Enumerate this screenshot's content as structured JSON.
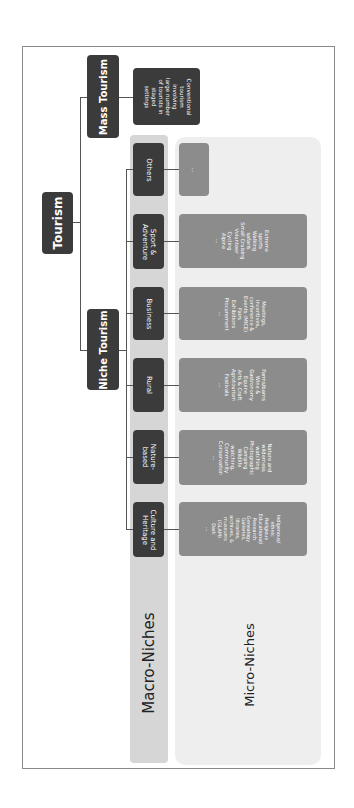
{
  "diagram": {
    "root": "Tourism",
    "branches": {
      "mass": {
        "label": "Mass Tourism",
        "description": [
          "Conventional",
          "tourism",
          "involving",
          "large number",
          "of tourists in",
          "staged",
          "settings"
        ]
      },
      "niche": {
        "label": "Niche Tourism"
      }
    },
    "levels": {
      "macro_label": "Macro-Niches",
      "micro_label": "Micro-Niches"
    },
    "macro_niches": [
      {
        "label": [
          "Culture and",
          "Heritage"
        ],
        "micro": [
          "Indigenous/",
          "ethnic",
          "Religious",
          "Educational/",
          "Research",
          "Genealogy",
          "Galleries,",
          "libraries,",
          "archives, &",
          "museums",
          "(GLAM)",
          "Dark",
          "..."
        ]
      },
      {
        "label": [
          "Nature-",
          "based"
        ],
        "micro": [
          "Nature and",
          "wilderness",
          "watching",
          "Photographic",
          "Camping",
          "Wildlife",
          "watching,",
          "Community",
          "Conservation",
          "..."
        ]
      },
      {
        "label": [
          "Rural"
        ],
        "micro": [
          "Farms/barns",
          "Wine &",
          "Gastronomy",
          "Equine",
          "Arts & Craft",
          "Agrotourism",
          "Festivals",
          "..."
        ]
      },
      {
        "label": [
          "Business"
        ],
        "micro": [
          "Meetings,",
          "Incentives,",
          "conference &",
          "Events (MICE)",
          "Fairs",
          "Exhibitions",
          "Procurement",
          "..."
        ]
      },
      {
        "label": [
          "Sport &",
          "Adventure"
        ],
        "micro": [
          "Extreme",
          "sports",
          "Walking",
          "safaris",
          "Small Cruising",
          "Volunteer",
          "Cycling",
          "Alpine",
          "..."
        ]
      },
      {
        "label": [
          "Others"
        ],
        "micro": [
          "..."
        ]
      }
    ]
  },
  "colors": {
    "dark_box": "#3b3b3b",
    "micro_box": "#8c8c8c",
    "macro_strip": "#d6d6d6",
    "micro_strip": "#eeeeee"
  }
}
